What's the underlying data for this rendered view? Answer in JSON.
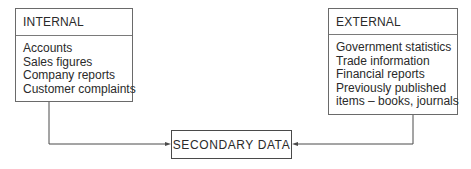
{
  "diagram": {
    "internal": {
      "title": "INTERNAL",
      "items": [
        "Accounts",
        "Sales figures",
        "Company reports",
        "Customer complaints"
      ]
    },
    "external": {
      "title": "EXTERNAL",
      "items": [
        "Government statistics",
        "Trade information",
        "Financial reports",
        "Previously published",
        "items – books, journals"
      ]
    },
    "target": {
      "label": "SECONDARY DATA"
    },
    "edges": [
      {
        "from": "INTERNAL",
        "to": "SECONDARY DATA"
      },
      {
        "from": "EXTERNAL",
        "to": "SECONDARY DATA"
      }
    ],
    "colors": {
      "line": "#4a4a4a",
      "text": "#2a2a2a",
      "background": "#ffffff"
    }
  }
}
